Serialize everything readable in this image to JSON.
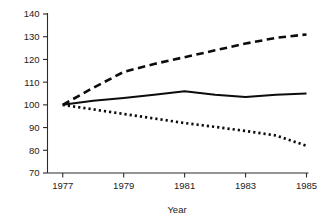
{
  "chart_data": {
    "type": "line",
    "title": "",
    "subtitle": "",
    "xlabel": "Year",
    "ylabel": "",
    "x": [
      1977,
      1978,
      1979,
      1980,
      1981,
      1982,
      1983,
      1984,
      1985
    ],
    "xlim": [
      1976.5,
      1985
    ],
    "ylim": [
      70,
      140
    ],
    "xtick_labels": [
      "1977",
      "1979",
      "1981",
      "1983",
      "1985"
    ],
    "xtick_values": [
      1977,
      1979,
      1981,
      1983,
      1985
    ],
    "ytick_labels": [
      "70",
      "80",
      "90",
      "100",
      "110",
      "120",
      "130",
      "140"
    ],
    "ytick_values": [
      70,
      80,
      90,
      100,
      110,
      120,
      130,
      140
    ],
    "grid": false,
    "legend": "none",
    "frame": "left-bottom-only",
    "annotations": [],
    "series": [
      {
        "name": "dashed-series",
        "style": "dashed",
        "color": "#0c0c0c",
        "values": [
          100,
          107.5,
          114.5,
          118,
          121,
          124,
          127,
          129.5,
          131
        ]
      },
      {
        "name": "solid-series",
        "style": "solid",
        "color": "#0c0c0c",
        "values": [
          100,
          101.8,
          103,
          104.5,
          106,
          104.5,
          103.5,
          104.5,
          105
        ]
      },
      {
        "name": "dotted-series",
        "style": "dotted",
        "color": "#0c0c0c",
        "values": [
          100,
          98,
          96,
          94,
          92,
          90.3,
          88.5,
          86.5,
          82
        ]
      }
    ]
  }
}
